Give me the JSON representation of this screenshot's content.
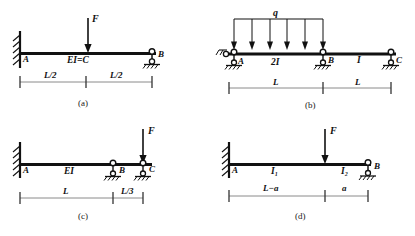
{
  "figure": {
    "title_caption_style": "lettered",
    "background_color": "#ffffff",
    "line_color": "#111111",
    "dim_line_color": "#777777"
  },
  "panels": [
    {
      "id": "a",
      "caption": "(a)",
      "beam_label": "EI=C",
      "supports": [
        {
          "node": "A",
          "type": "fixed-wall",
          "label": "A"
        },
        {
          "node": "B",
          "type": "pin-roller",
          "label": "B"
        }
      ],
      "loads": [
        {
          "type": "point-force",
          "label": "F",
          "position": "midspan",
          "direction": "down"
        }
      ],
      "dimensions": [
        {
          "label": "L/2"
        },
        {
          "label": "L/2"
        }
      ]
    },
    {
      "id": "b",
      "caption": "(b)",
      "segment_labels": [
        "2I",
        "I"
      ],
      "supports": [
        {
          "node": "A",
          "type": "pin-hatched",
          "label": "A"
        },
        {
          "node": "B",
          "type": "pin-hatched",
          "label": "B"
        },
        {
          "node": "C",
          "type": "pin-hatched",
          "label": "C"
        }
      ],
      "loads": [
        {
          "type": "distributed-load",
          "label": "q",
          "arrow_count": 6,
          "direction": "down",
          "span": "A-B"
        }
      ],
      "dimensions": [
        {
          "label": "L"
        },
        {
          "label": "L"
        }
      ]
    },
    {
      "id": "c",
      "caption": "(c)",
      "beam_label": "EI",
      "supports": [
        {
          "node": "A",
          "type": "fixed-wall",
          "label": "A"
        },
        {
          "node": "B",
          "type": "pin-hatched",
          "label": "B"
        },
        {
          "node": "C",
          "type": "pin-hatched",
          "label": "C"
        }
      ],
      "loads": [
        {
          "type": "point-force",
          "label": "F",
          "position": "at-C",
          "direction": "down"
        }
      ],
      "dimensions": [
        {
          "label": "L"
        },
        {
          "label": "L/3"
        }
      ]
    },
    {
      "id": "d",
      "caption": "(d)",
      "segment_labels": [
        "I₁",
        "I₂"
      ],
      "supports": [
        {
          "node": "A",
          "type": "fixed-wall",
          "label": "A"
        },
        {
          "node": "B",
          "type": "pin-roller",
          "label": "B"
        }
      ],
      "loads": [
        {
          "type": "point-force",
          "label": "F",
          "position": "at-L-minus-a",
          "direction": "down"
        }
      ],
      "dimensions": [
        {
          "label": "L−a"
        },
        {
          "label": "a"
        }
      ]
    }
  ]
}
